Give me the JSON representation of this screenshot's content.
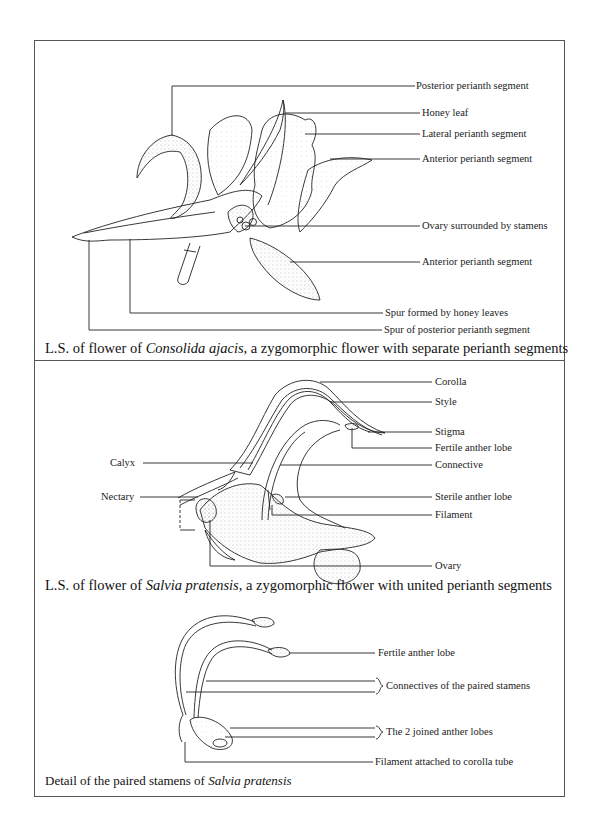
{
  "figure": {
    "panels": [
      {
        "id": "consolida",
        "caption_prefix": "L.S. of flower of ",
        "caption_species": "Consolida ajacis",
        "caption_suffix": ", a zygomorphic flower with separate perianth segments",
        "labels": [
          "Posterior perianth segment",
          "Honey leaf",
          "Lateral perianth segment",
          "Anterior perianth segment",
          "Ovary surrounded by stamens",
          "Anterior perianth segment",
          "Spur formed by honey leaves",
          "Spur of posterior perianth segment"
        ]
      },
      {
        "id": "salvia",
        "caption_prefix": "L.S. of flower of ",
        "caption_species": "Salvia pratensis,",
        "caption_suffix": " a zygomorphic flower with united perianth segments",
        "labels_right": [
          "Corolla",
          "Style",
          "Stigma",
          "Fertile anther lobe",
          "Connective",
          "Sterile anther lobe",
          "Filament",
          "Ovary"
        ],
        "labels_left": [
          "Calyx",
          "Nectary"
        ]
      },
      {
        "id": "stamens",
        "caption_prefix": "Detail of the paired stamens of ",
        "caption_species": "Salvia pratensis",
        "caption_suffix": "",
        "labels": [
          "Fertile anther lobe",
          "Connectives of the paired stamens",
          "The 2 joined anther lobes",
          "Filament attached to corolla tube"
        ]
      }
    ]
  }
}
